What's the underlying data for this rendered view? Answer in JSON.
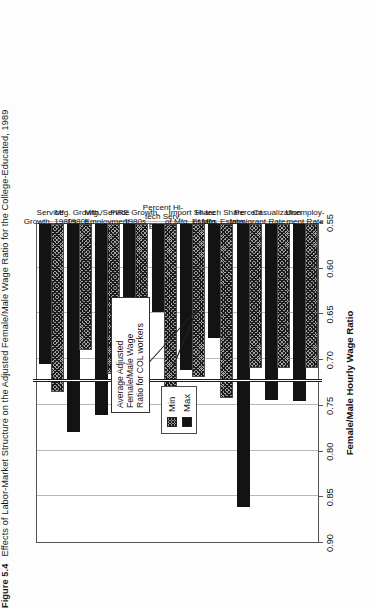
{
  "caption": {
    "figure_number": "Figure 5.4",
    "text": "Effects of Labor-Market Structure on the Adjusted Female/Male Wage Ratio for the College-Educated, 1989"
  },
  "legend": {
    "items": [
      {
        "label": "Min",
        "swatch": "hatched-swatch"
      },
      {
        "label": "Max",
        "swatch": "solid-black-swatch"
      }
    ]
  },
  "annotation": {
    "line1": "Average Adjusted",
    "line2": "Female/Male Wage",
    "line3": "Ratio for COL workers",
    "value": 0.7245
  },
  "chart_data": {
    "type": "bar",
    "title": "",
    "orientation": "horizontal",
    "xlabel": "Female/Male Hourly Wage Ratio",
    "ylabel": "",
    "xlim": [
      0.9,
      0.55
    ],
    "ticks": [
      "0.90",
      "0.85",
      "0.80",
      "0.75",
      "0.70",
      "0.65",
      "0.60",
      "0.55"
    ],
    "tick_values": [
      0.9,
      0.85,
      0.8,
      0.75,
      0.7,
      0.65,
      0.6,
      0.55
    ],
    "grid": true,
    "legend_position": "top-center",
    "reference_line": {
      "label": "Average Adjusted Female/Male Wage Ratio for COL workers",
      "value": 0.7245
    },
    "categories": [
      "Unemploy-\nment Rate",
      "Casualization\nRate",
      "Percent\nImmigrant",
      "Hi-tech Share\nof Mfg. Estabs.",
      "Import Share\nof Mfg. Estabs.",
      "Percent Hi-\ntech Serv.\nEmploy.",
      "FIRE Growth,\n1980s",
      "Mfg./Service\nEmployment",
      "Mfg. Growth,\n1980s",
      "Service\nGrowth, 1980s"
    ],
    "series": [
      {
        "name": "Min",
        "values": [
          0.71,
          0.71,
          0.71,
          0.743,
          0.719,
          0.735,
          0.721,
          0.716,
          0.69,
          0.736
        ]
      },
      {
        "name": "Max",
        "values": [
          0.746,
          0.745,
          0.862,
          0.677,
          0.712,
          0.648,
          0.721,
          0.761,
          0.78,
          0.705
        ]
      }
    ]
  }
}
